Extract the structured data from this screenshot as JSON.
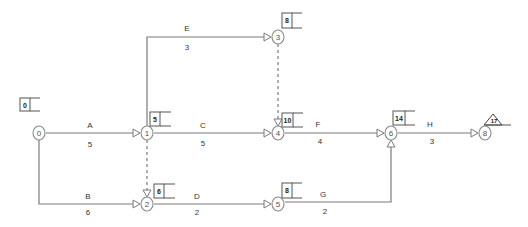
{
  "diagram": {
    "type": "activity-on-arrow network",
    "nodes": [
      {
        "id": "0",
        "label": "0",
        "x": 39,
        "y": 133,
        "early_time": "0",
        "box": {
          "x": 20,
          "y": 98
        }
      },
      {
        "id": "1",
        "label": "1",
        "x": 147,
        "y": 133,
        "early_time": "5",
        "box": {
          "x": 150,
          "y": 112
        }
      },
      {
        "id": "2",
        "label": "2",
        "x": 147,
        "y": 204,
        "early_time": "6",
        "box": {
          "x": 154,
          "y": 184
        }
      },
      {
        "id": "3",
        "label": "3",
        "x": 278,
        "y": 37,
        "early_time": "8",
        "box": {
          "x": 281,
          "y": 13
        }
      },
      {
        "id": "4",
        "label": "4",
        "x": 278,
        "y": 133,
        "early_time": "10",
        "box": {
          "x": 282,
          "y": 112
        }
      },
      {
        "id": "5",
        "label": "5",
        "x": 278,
        "y": 204,
        "early_time": "8",
        "box": {
          "x": 282,
          "y": 183
        }
      },
      {
        "id": "6",
        "label": "6",
        "x": 391,
        "y": 133,
        "early_time": "14",
        "box": {
          "x": 393,
          "y": 111
        }
      },
      {
        "id": "8",
        "label": "8",
        "x": 485,
        "y": 133,
        "early_time": "17",
        "triangle": {
          "x": 492,
          "y": 122
        }
      }
    ],
    "activities": [
      {
        "name": "A",
        "duration": "5",
        "from": "0",
        "to": "1"
      },
      {
        "name": "B",
        "duration": "6",
        "from": "0",
        "to": "2"
      },
      {
        "name": "C",
        "duration": "5",
        "from": "1",
        "to": "4"
      },
      {
        "name": "D",
        "duration": "2",
        "from": "2",
        "to": "5"
      },
      {
        "name": "E",
        "duration": "3",
        "from": "1",
        "to": "3"
      },
      {
        "name": "F",
        "duration": "4",
        "from": "4",
        "to": "6"
      },
      {
        "name": "G",
        "duration": "2",
        "from": "5",
        "to": "6"
      },
      {
        "name": "H",
        "duration": "3",
        "from": "6",
        "to": "8"
      }
    ],
    "dummies": [
      {
        "from": "1",
        "to": "2"
      },
      {
        "from": "3",
        "to": "4"
      }
    ],
    "colors": {
      "line": "#7a7a7a",
      "node_stroke": "#8a8a8a",
      "text": "#333333",
      "background": "#ffffff"
    }
  }
}
